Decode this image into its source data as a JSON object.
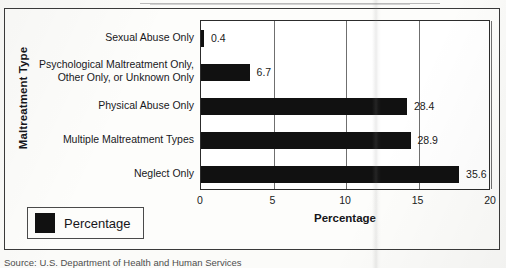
{
  "figure": {
    "source_note": "Source: U.S. Department of Health and Human Services"
  },
  "chart_data": {
    "type": "bar",
    "orientation": "horizontal",
    "title": "",
    "xlabel": "Percentage",
    "ylabel": "Maltreatment Type",
    "categories": [
      "Sexual Abuse Only",
      "Psychological Maltreatment Only, Other Only, or Unknown Only",
      "Physical Abuse Only",
      "Multiple Maltreatment Types",
      "Neglect Only"
    ],
    "category_lines": [
      [
        "Sexual Abuse Only"
      ],
      [
        "Psychological Maltreatment Only,",
        "Other Only, or Unknown Only"
      ],
      [
        "Physical Abuse Only"
      ],
      [
        "Multiple Maltreatment Types"
      ],
      [
        "Neglect Only"
      ]
    ],
    "values": [
      0.4,
      6.7,
      28.4,
      28.9,
      35.6
    ],
    "value_labels": [
      "0.4",
      "6.7",
      "28.4",
      "28.9",
      "35.6"
    ],
    "xticks": [
      0,
      5,
      10,
      15,
      20
    ],
    "xtick_labels": [
      "0",
      "5",
      "10",
      "15",
      "20"
    ],
    "xlim": [
      0,
      20
    ],
    "bar_scale_factor": 0.5,
    "grid": true,
    "grid_axis": "x",
    "legend": {
      "position": "lower-left-outside",
      "entries": [
        {
          "label": "Percentage",
          "color": "#111111"
        }
      ]
    },
    "colors": {
      "bar": "#111111",
      "axis": "#2c2c2c",
      "grid": "#6f6f6f",
      "text": "#16161a",
      "background": "#fdfdfb"
    }
  }
}
